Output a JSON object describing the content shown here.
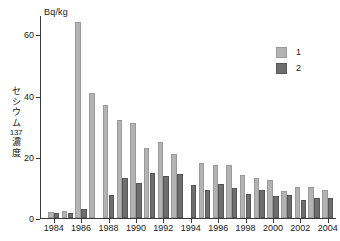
{
  "chart_data": {
    "type": "bar",
    "title": "",
    "unit_label": "Bq/kg",
    "xlabel": "",
    "ylabel": "セシウム137濃度",
    "ylabel_chars": [
      "セ",
      "シ",
      "ウ",
      "ム"
    ],
    "ylabel_isotope": "137",
    "ylabel_tail": "濃度",
    "ylim": [
      0,
      66
    ],
    "ytick_labels": [
      "0",
      "20",
      "40",
      "60"
    ],
    "ytick_values": [
      0,
      20,
      40,
      60
    ],
    "grid": false,
    "legend_position": "top-right",
    "categories": [
      "1984",
      "1985",
      "1986",
      "1987",
      "1988",
      "1989",
      "1990",
      "1991",
      "1992",
      "1993",
      "1994",
      "1995",
      "1996",
      "1997",
      "1998",
      "1999",
      "2000",
      "2001",
      "2002",
      "2003",
      "2004"
    ],
    "xtick_labels": [
      "1984",
      "1986",
      "1988",
      "1990",
      "1992",
      "1994",
      "1996",
      "1998",
      "2000",
      "2002",
      "2004"
    ],
    "series": [
      {
        "name": "1",
        "color": "#b3b3b3",
        "values": [
          2.0,
          2.2,
          64.0,
          41.0,
          37.0,
          32.0,
          31.0,
          23.0,
          24.8,
          21.0,
          null,
          18.0,
          17.4,
          17.2,
          14.0,
          13.0,
          12.5,
          8.8,
          10.0,
          10.0,
          9.0
        ]
      },
      {
        "name": "2",
        "color": "#6e6e6e",
        "values": [
          1.6,
          1.6,
          3.0,
          null,
          7.4,
          13.0,
          11.4,
          14.8,
          13.8,
          14.5,
          10.8,
          9.2,
          11.0,
          9.8,
          7.8,
          9.2,
          7.2,
          7.4,
          6.0,
          6.4,
          6.4
        ]
      }
    ]
  },
  "legend": {
    "items": [
      {
        "label": "1",
        "color": "#b3b3b3"
      },
      {
        "label": "2",
        "color": "#6e6e6e"
      }
    ]
  }
}
